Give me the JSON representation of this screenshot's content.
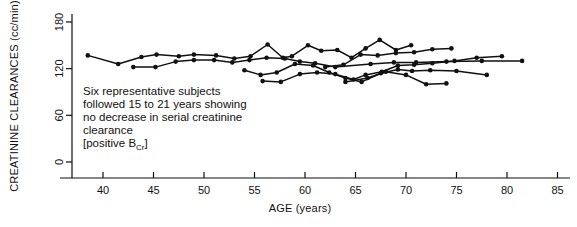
{
  "chart_data": {
    "type": "line",
    "title": "",
    "xlabel": "AGE (years)",
    "ylabel": "CREATININE CLEARANCES (cc/min)",
    "xlim": [
      35,
      85
    ],
    "ylim": [
      0,
      180
    ],
    "xticks": [
      40,
      45,
      50,
      55,
      60,
      65,
      70,
      75,
      80,
      85
    ],
    "yticks": [
      0,
      60,
      120,
      180
    ],
    "grid": false,
    "legend": "none",
    "annotations": [
      {
        "name": "caption",
        "lines": [
          "Six representative subjects",
          "followed 15 to 21 years showing",
          "no decrease in serial creatinine",
          "clearance"
        ],
        "bracket_line": "[positive B",
        "bracket_sub": "Cr",
        "bracket_close": "]"
      }
    ],
    "marker": "filled-circle",
    "series": [
      {
        "name": "subject-1",
        "points": [
          [
            38.5,
            137
          ],
          [
            41.5,
            126
          ],
          [
            43.8,
            135
          ],
          [
            45.3,
            138
          ],
          [
            47.5,
            136
          ],
          [
            49.0,
            138
          ],
          [
            51.2,
            137
          ],
          [
            53.0,
            133
          ],
          [
            54.6,
            136
          ],
          [
            56.3,
            151
          ],
          [
            57.8,
            134
          ],
          [
            58.7,
            136
          ],
          [
            60.3,
            150
          ],
          [
            61.6,
            143
          ],
          [
            63.2,
            144
          ],
          [
            64.6,
            134
          ],
          [
            66.0,
            146
          ],
          [
            67.4,
            157
          ],
          [
            69.0,
            144
          ],
          [
            70.5,
            150
          ]
        ]
      },
      {
        "name": "subject-2",
        "points": [
          [
            43.0,
            122
          ],
          [
            45.2,
            122
          ],
          [
            47.2,
            129
          ],
          [
            49.0,
            131
          ],
          [
            51.0,
            131
          ],
          [
            52.8,
            128
          ],
          [
            54.5,
            131
          ],
          [
            56.2,
            134
          ],
          [
            58.0,
            133
          ],
          [
            59.5,
            129
          ],
          [
            61.0,
            127
          ],
          [
            63.0,
            122
          ],
          [
            66.5,
            126
          ],
          [
            68.8,
            128
          ],
          [
            71.0,
            128
          ],
          [
            74.0,
            129
          ],
          [
            77.5,
            130
          ],
          [
            81.5,
            130
          ]
        ]
      },
      {
        "name": "subject-3",
        "points": [
          [
            54.0,
            118
          ],
          [
            55.6,
            112
          ],
          [
            57.2,
            115
          ],
          [
            59.0,
            126
          ],
          [
            60.8,
            124
          ],
          [
            62.4,
            115
          ],
          [
            64.0,
            108
          ],
          [
            65.6,
            103
          ],
          [
            67.5,
            114
          ],
          [
            69.2,
            119
          ],
          [
            70.6,
            117
          ],
          [
            72.4,
            118
          ],
          [
            75.0,
            117
          ],
          [
            78.0,
            112
          ]
        ]
      },
      {
        "name": "subject-4",
        "points": [
          [
            55.8,
            104
          ],
          [
            57.6,
            103
          ],
          [
            59.5,
            113
          ],
          [
            61.2,
            115
          ],
          [
            63.0,
            113
          ],
          [
            64.8,
            106
          ],
          [
            66.0,
            112
          ],
          [
            67.6,
            116
          ],
          [
            69.2,
            124
          ],
          [
            70.8,
            125
          ],
          [
            72.6,
            127
          ],
          [
            74.8,
            130
          ],
          [
            77.0,
            134
          ],
          [
            79.5,
            136
          ]
        ]
      },
      {
        "name": "subject-5",
        "points": [
          [
            62.0,
            122
          ],
          [
            63.8,
            125
          ],
          [
            65.5,
            138
          ],
          [
            67.2,
            137
          ],
          [
            69.0,
            140
          ],
          [
            70.8,
            141
          ],
          [
            72.6,
            145
          ],
          [
            74.5,
            146
          ]
        ]
      },
      {
        "name": "subject-6",
        "points": [
          [
            64.0,
            103
          ],
          [
            66.2,
            108
          ],
          [
            68.0,
            116
          ],
          [
            70.0,
            112
          ],
          [
            72.0,
            100
          ],
          [
            74.0,
            101
          ]
        ]
      }
    ]
  },
  "axis": {
    "y_label": "CREATININE CLEARANCES (cc/min)",
    "x_label": "AGE (years)",
    "y_tick_labels": [
      "0",
      "60",
      "120",
      "180"
    ],
    "x_tick_labels": [
      "40",
      "45",
      "50",
      "55",
      "60",
      "65",
      "70",
      "75",
      "80",
      "85"
    ]
  },
  "colors": {
    "ink": "#111111",
    "background": "#ffffff"
  }
}
